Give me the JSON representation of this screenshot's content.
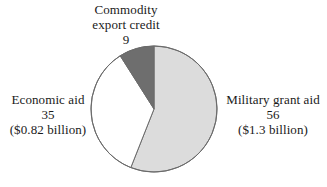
{
  "chart_data": {
    "type": "pie",
    "title": "",
    "subtitle": "",
    "xlabel": "",
    "ylabel": "",
    "legend_position": "none",
    "grid": false,
    "units": "percent",
    "start_angle_deg": 0,
    "direction": "clockwise",
    "categories": [
      "Military grant aid",
      "Economic aid",
      "Commodity export credit"
    ],
    "values": [
      56,
      35,
      9
    ],
    "slices": [
      {
        "name": "Military grant aid",
        "percent": 56,
        "percent_text": "56",
        "amount_text": "($1.3 billion)",
        "amount_value": 1.3,
        "amount_units": "billion dollars",
        "color": "#dcdcdc",
        "start_deg": 0,
        "end_deg": 201.6,
        "label_position": "right"
      },
      {
        "name": "Economic aid",
        "percent": 35,
        "percent_text": "35",
        "amount_text": "($0.82 billion)",
        "amount_value": 0.82,
        "amount_units": "billion dollars",
        "color": "#ffffff",
        "start_deg": 201.6,
        "end_deg": 327.6,
        "label_position": "left"
      },
      {
        "name": "Commodity export credit",
        "percent": 9,
        "percent_text": "9",
        "amount_text": "",
        "amount_value": null,
        "amount_units": "",
        "color": "#6e6e6e",
        "start_deg": 327.6,
        "end_deg": 360,
        "label_position": "top"
      }
    ],
    "annotations": []
  },
  "labels": {
    "commodity": {
      "line1": "Commodity",
      "line2": "export credit",
      "line3": "9"
    },
    "economic": {
      "line1": "Economic aid",
      "line2": "35",
      "line3": "($0.82 billion)"
    },
    "military": {
      "line1": "Military grant aid",
      "line2": "56",
      "line3": "($1.3 billion)"
    }
  },
  "colors": {
    "background": "#ffffff",
    "text": "#1a1a1a",
    "slice_outline": "#6b6b6b",
    "slice_light_gray": "#dcdcdc",
    "slice_white": "#ffffff",
    "slice_dark_gray": "#6e6e6e"
  }
}
